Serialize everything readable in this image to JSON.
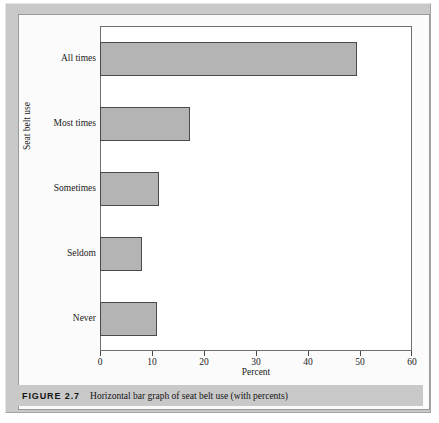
{
  "figure": {
    "number_label": "FIGURE 2.7",
    "caption": "Horizontal bar graph of seat belt use (with percents)"
  },
  "colors": {
    "bar_fill": "#b4b4b4",
    "bar_stroke": "#4a4a4a",
    "frame": "#c9c9c9",
    "panel_background": "#ffffff"
  },
  "chart_data": {
    "type": "bar",
    "orientation": "horizontal",
    "title": "",
    "xlabel": "Percent",
    "ylabel": "Seat belt use",
    "categories": [
      "All times",
      "Most times",
      "Sometimes",
      "Seldom",
      "Never"
    ],
    "values": [
      49.5,
      17.3,
      11.3,
      8.0,
      11.0
    ],
    "xlim": [
      0,
      60
    ],
    "xticks": [
      0,
      10,
      20,
      30,
      40,
      50,
      60
    ],
    "xtick_labels": [
      "0",
      "10",
      "20",
      "30",
      "40",
      "50",
      "60"
    ],
    "grid": false,
    "legend": false
  }
}
